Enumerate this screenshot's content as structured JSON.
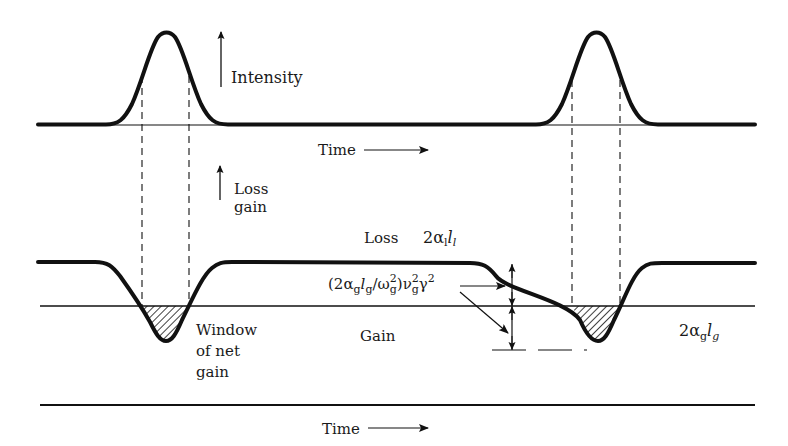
{
  "labels": {
    "intensity": "Intensity",
    "time_top": "Time",
    "loss_gain_line1": "Loss",
    "loss_gain_line2": "gain",
    "loss": "Loss",
    "loss_coef_base": "2α",
    "loss_coef_sub": "l",
    "loss_len_base": "l",
    "loss_len_sub": "l",
    "gain": "Gain",
    "gain_coef_base": "2α",
    "gain_coef_sub": "g",
    "gain_len_base": "l",
    "gain_len_sub": "g",
    "window_line1": "Window",
    "window_line2": "of net",
    "window_line3": "gain",
    "time_bottom": "Time",
    "formula": {
      "open": "(2α",
      "s1": "g",
      "l": "l",
      "s2": "g",
      "slash": "/ω",
      "sup1": "2",
      "s3": "g",
      "close_nu": ")ν",
      "sup2": "2",
      "s4": "g",
      "gamma": "γ",
      "sup3": "2"
    }
  },
  "colors": {
    "ink": "#111111",
    "background": "#ffffff"
  }
}
